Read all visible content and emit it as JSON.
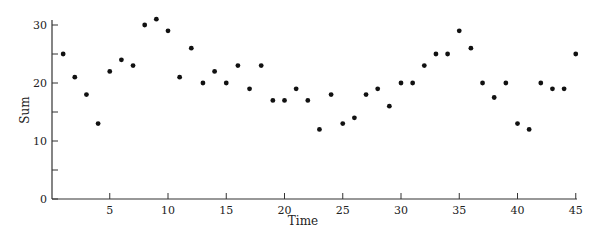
{
  "chart_data": {
    "type": "scatter",
    "title": "",
    "xlabel": "Time",
    "ylabel": "Sum",
    "x": [
      1,
      2,
      3,
      4,
      5,
      6,
      7,
      8,
      9,
      10,
      11,
      12,
      13,
      14,
      15,
      16,
      17,
      18,
      19,
      20,
      21,
      22,
      23,
      24,
      25,
      26,
      27,
      28,
      29,
      30,
      31,
      32,
      33,
      34,
      35,
      36,
      37,
      38,
      39,
      40,
      41,
      42,
      43,
      44,
      45
    ],
    "values": [
      25,
      21,
      18,
      13,
      22,
      24,
      23,
      30,
      31,
      29,
      21,
      26,
      20,
      22,
      20,
      23,
      19,
      23,
      17,
      17,
      19,
      17,
      12,
      18,
      13,
      14,
      18,
      19,
      16,
      20,
      20,
      23,
      25,
      25,
      29,
      26,
      20,
      17.5,
      20,
      13,
      12,
      20,
      19,
      19,
      25
    ],
    "xlim": [
      0,
      45.5
    ],
    "ylim": [
      0,
      31
    ],
    "xticks": [
      5,
      10,
      15,
      20,
      25,
      30,
      35,
      40,
      45
    ],
    "xtick_labels": [
      "5",
      "10",
      "15",
      "20",
      "25",
      "30",
      "35",
      "40",
      "45"
    ],
    "yticks": [
      0,
      10,
      20,
      30
    ],
    "ytick_labels": [
      "0",
      "10",
      "20",
      "30"
    ],
    "yminor_ticks": [
      5,
      15,
      25
    ],
    "grid": false,
    "legend": null,
    "marker_color": "#111111"
  }
}
